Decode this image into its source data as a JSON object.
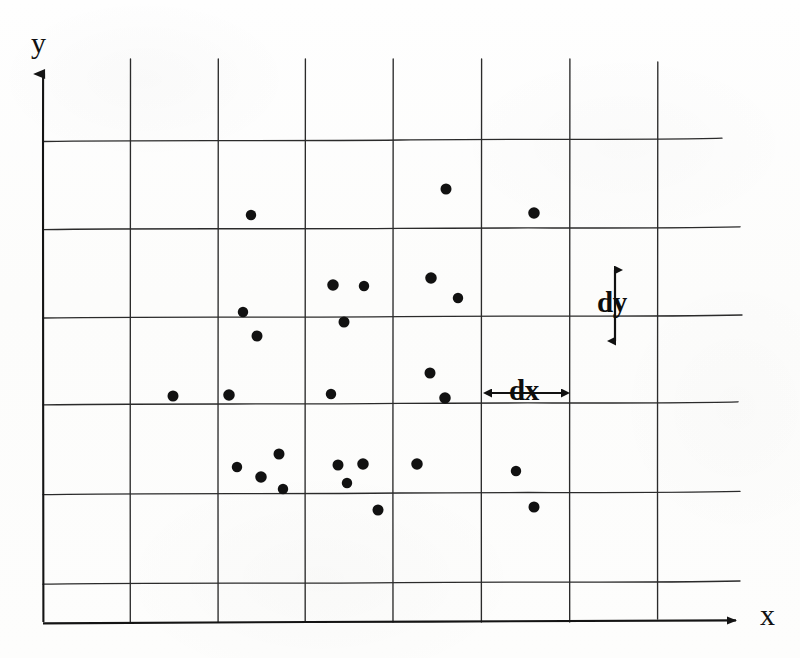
{
  "figure": {
    "background_color": "#fdfdfc",
    "ink_color": "#1a1a1a",
    "dot_color": "#111111"
  },
  "axes": {
    "y_label": "y",
    "x_label": "x",
    "x_axis": {
      "y_px": 622,
      "x_start_px": 43,
      "x_end_px": 748
    },
    "y_axis": {
      "x_px": 43,
      "y_start_px": 622,
      "y_end_px": 58
    }
  },
  "annotations": {
    "dy": {
      "label": "dy",
      "orientation": "vertical",
      "x_px": 615,
      "y_top_px": 262,
      "y_bottom_px": 349,
      "meaning": "grid cell height"
    },
    "dx": {
      "label": "dx",
      "orientation": "horizontal",
      "y_px": 393,
      "x_left_px": 483,
      "x_right_px": 570,
      "meaning": "grid cell width"
    }
  },
  "chart_data": {
    "type": "scatter",
    "xlabel": "x",
    "ylabel": "y",
    "grid": true,
    "grid_spacing": {
      "dx_px": 87.5,
      "dy_px": 87.0
    },
    "grid_vertical_lines_px": [
      43,
      130,
      218,
      305,
      393,
      482,
      570,
      658
    ],
    "grid_horizontal_lines_px": [
      140,
      228,
      317,
      403,
      493,
      583,
      622
    ],
    "grid_extent_px": {
      "left": 43,
      "right": 720,
      "top": 58,
      "bottom": 622
    },
    "point_count": 27,
    "point_radius_px": 5.5,
    "points_px": [
      {
        "x": 251,
        "y": 215
      },
      {
        "x": 446,
        "y": 189
      },
      {
        "x": 534,
        "y": 213
      },
      {
        "x": 243,
        "y": 312
      },
      {
        "x": 257,
        "y": 336
      },
      {
        "x": 333,
        "y": 285
      },
      {
        "x": 364,
        "y": 286
      },
      {
        "x": 344,
        "y": 322
      },
      {
        "x": 431,
        "y": 278
      },
      {
        "x": 458,
        "y": 298
      },
      {
        "x": 173,
        "y": 396
      },
      {
        "x": 229,
        "y": 395
      },
      {
        "x": 331,
        "y": 394
      },
      {
        "x": 430,
        "y": 373
      },
      {
        "x": 445,
        "y": 398
      },
      {
        "x": 237,
        "y": 467
      },
      {
        "x": 279,
        "y": 454
      },
      {
        "x": 261,
        "y": 477
      },
      {
        "x": 283,
        "y": 489
      },
      {
        "x": 338,
        "y": 465
      },
      {
        "x": 363,
        "y": 464
      },
      {
        "x": 347,
        "y": 483
      },
      {
        "x": 378,
        "y": 510
      },
      {
        "x": 417,
        "y": 464
      },
      {
        "x": 516,
        "y": 471
      },
      {
        "x": 534,
        "y": 507
      },
      {
        "x": 534,
        "y": 213
      }
    ]
  }
}
